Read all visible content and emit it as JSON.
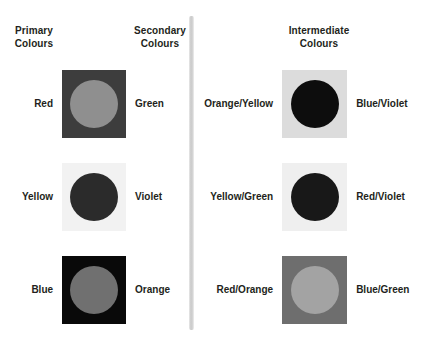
{
  "diagram": {
    "background": "#ffffff",
    "text_colour": "#231f20",
    "divider_colour": "#c9c9c9"
  },
  "headings": {
    "primary": "Primary\nColours",
    "secondary": "Secondary\nColours",
    "intermediate": "Intermediate\nColours"
  },
  "pairs": {
    "left": [
      {
        "left_label": "Red",
        "right_label": "Green",
        "square_colour": "#3d3d3d",
        "circle_colour": "#8f8f8f"
      },
      {
        "left_label": "Yellow",
        "right_label": "Violet",
        "square_colour": "#f2f2f2",
        "circle_colour": "#2b2b2b"
      },
      {
        "left_label": "Blue",
        "right_label": "Orange",
        "square_colour": "#090909",
        "circle_colour": "#707070"
      }
    ],
    "right": [
      {
        "left_label": "Orange/Yellow",
        "right_label": "Blue/Violet",
        "square_colour": "#dcdcdc",
        "circle_colour": "#0d0d0d"
      },
      {
        "left_label": "Yellow/Green",
        "right_label": "Red/Violet",
        "square_colour": "#efefef",
        "circle_colour": "#181818"
      },
      {
        "left_label": "Red/Orange",
        "right_label": "Blue/Green",
        "square_colour": "#6e6e6e",
        "circle_colour": "#a3a3a3"
      }
    ]
  }
}
